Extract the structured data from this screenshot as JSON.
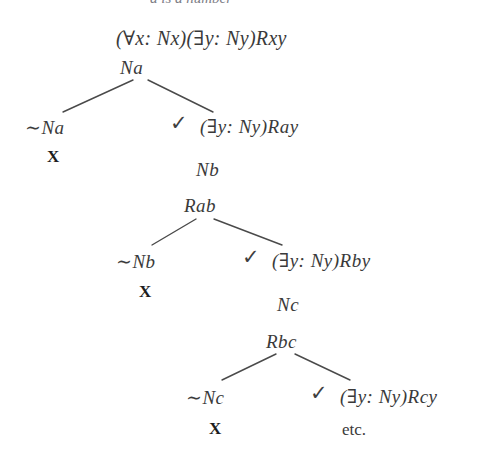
{
  "page": {
    "width": 502,
    "height": 464,
    "background": "#ffffff",
    "ink": "#3a3a3a",
    "line_color": "#4a4a4a",
    "closure_color": "#1d1d1d"
  },
  "cropped_header": {
    "text": "a is a number",
    "note": "partially cropped line of body text at very top edge"
  },
  "tree": {
    "title": "truth-tree / semantic tableau",
    "nodes": [
      {
        "id": "root",
        "label": "(∀x: Nx)(↑y: Ny)Rxy",
        "text": "(∀x: Nx)(∃y: Ny)Rxy",
        "x": 116,
        "y": 28,
        "kind": "formula",
        "checked": false
      },
      {
        "id": "na",
        "text": "Na",
        "x": 120,
        "y": 58,
        "kind": "formula",
        "checked": false
      },
      {
        "id": "not-na",
        "text": "∼Na",
        "x": 25,
        "y": 118,
        "kind": "formula",
        "checked": false
      },
      {
        "id": "exists-ray",
        "text": "(∃y: Ny)Ray",
        "x": 200,
        "y": 117,
        "kind": "formula",
        "checked": true,
        "check_x": 170,
        "check_y": 113
      },
      {
        "id": "nb",
        "text": "Nb",
        "x": 196,
        "y": 160,
        "kind": "formula",
        "checked": false
      },
      {
        "id": "rab",
        "text": "Rab",
        "x": 184,
        "y": 196,
        "kind": "formula",
        "checked": false
      },
      {
        "id": "not-nb",
        "text": "∼Nb",
        "x": 116,
        "y": 252,
        "kind": "formula",
        "checked": false
      },
      {
        "id": "exists-rby",
        "text": "(∃y: Ny)Rby",
        "x": 272,
        "y": 251,
        "kind": "formula",
        "checked": true,
        "check_x": 242,
        "check_y": 247
      },
      {
        "id": "nc",
        "text": "Nc",
        "x": 277,
        "y": 295,
        "kind": "formula",
        "checked": false
      },
      {
        "id": "rbc",
        "text": "Rbc",
        "x": 266,
        "y": 332,
        "kind": "formula",
        "checked": false
      },
      {
        "id": "not-nc",
        "text": "∼Nc",
        "x": 186,
        "y": 388,
        "kind": "formula",
        "checked": false
      },
      {
        "id": "exists-rcy",
        "text": "(∃y: Ny)Rcy",
        "x": 340,
        "y": 387,
        "kind": "formula",
        "checked": true,
        "check_x": 310,
        "check_y": 383
      }
    ],
    "closures": [
      {
        "id": "close-1",
        "text": "X",
        "x": 47,
        "y": 148
      },
      {
        "id": "close-2",
        "text": "X",
        "x": 139,
        "y": 283
      },
      {
        "id": "close-3",
        "text": "X",
        "x": 209,
        "y": 420
      }
    ],
    "continuation": {
      "id": "etc",
      "text": "etc.",
      "x": 342,
      "y": 421
    },
    "branch_lines": [
      {
        "id": "b1-left",
        "x1": 133,
        "y1": 80,
        "x2": 63,
        "y2": 112
      },
      {
        "id": "b1-right",
        "x1": 148,
        "y1": 80,
        "x2": 213,
        "y2": 112
      },
      {
        "id": "b2-left",
        "x1": 196,
        "y1": 219,
        "x2": 152,
        "y2": 245
      },
      {
        "id": "b2-right",
        "x1": 214,
        "y1": 219,
        "x2": 282,
        "y2": 245
      },
      {
        "id": "b3-left",
        "x1": 276,
        "y1": 354,
        "x2": 222,
        "y2": 380
      },
      {
        "id": "b3-right",
        "x1": 295,
        "y1": 354,
        "x2": 350,
        "y2": 380
      }
    ]
  },
  "symbols": {
    "universal_quantifier": "∀",
    "existential_quantifier": "∃",
    "negation": "∼",
    "check_mark": "✓",
    "closure_mark": "X"
  }
}
